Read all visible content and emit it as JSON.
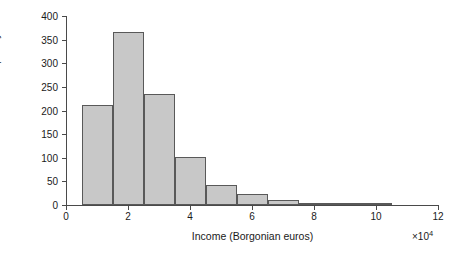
{
  "chart_data": {
    "type": "bar",
    "title": "",
    "subtitle": "",
    "xlabel": "Income (Borgonian euros)",
    "x_multiplier": "×10",
    "x_multiplier_exponent": "4",
    "ylabel": "Frequency",
    "xlim": [
      0,
      12
    ],
    "ylim": [
      0,
      400
    ],
    "xticks": [
      0,
      2,
      4,
      6,
      8,
      10,
      12
    ],
    "xtick_labels": [
      "0",
      "2",
      "4",
      "6",
      "8",
      "10",
      "12"
    ],
    "yticks": [
      0,
      50,
      100,
      150,
      200,
      250,
      300,
      350,
      400
    ],
    "ytick_labels": [
      "0",
      "50",
      "100",
      "150",
      "200",
      "250",
      "300",
      "350",
      "400"
    ],
    "grid": false,
    "legend": false,
    "bin_width": 1,
    "bin_edges": [
      0.5,
      1.5,
      2.5,
      3.5,
      4.5,
      5.5,
      6.5,
      7.5,
      8.5,
      9.5,
      10.5
    ],
    "bin_centers": [
      1,
      2,
      3,
      4,
      5,
      6,
      7,
      8,
      9,
      10
    ],
    "categories": [
      "0.5-1.5",
      "1.5-2.5",
      "2.5-3.5",
      "3.5-4.5",
      "4.5-5.5",
      "5.5-6.5",
      "6.5-7.5",
      "7.5-8.5",
      "8.5-9.5",
      "9.5-10.5"
    ],
    "values": [
      211,
      366,
      236,
      101,
      42,
      23,
      11,
      4,
      2,
      1
    ],
    "bar_fill_color": "#c8c8c8",
    "bar_edge_color": "#595959",
    "axis_color": "#4a4a4a",
    "background_color": "#ffffff"
  }
}
